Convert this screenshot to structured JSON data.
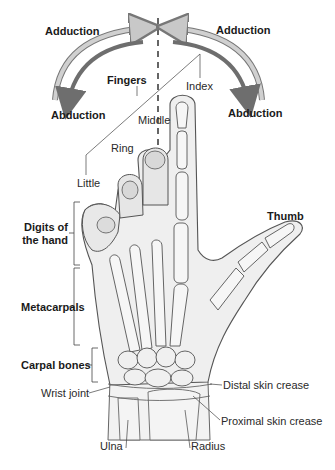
{
  "diagram": {
    "colors": {
      "adduction_arrow": "#c8c8c8",
      "abduction_arrow": "#6e6e6e",
      "midline": "#333333",
      "skin": "#efefef",
      "bone": "#f6f6f6",
      "outline": "#555555",
      "leader": "#444444"
    },
    "movements": {
      "left_adduction": "Adduction",
      "right_adduction": "Adduction",
      "left_abduction": "Abduction",
      "right_abduction": "Abduction"
    },
    "fingers": {
      "group_label": "Fingers",
      "index": "Index",
      "middle": "Middle",
      "ring": "Ring",
      "little": "Little",
      "thumb": "Thumb"
    },
    "regions": {
      "digits_line1": "Digits of",
      "digits_line2": "the hand",
      "metacarpals": "Metacarpals",
      "carpal_bones": "Carpal bones",
      "wrist_joint": "Wrist joint"
    },
    "right_labels": {
      "distal_crease": "Distal skin crease",
      "proximal_crease": "Proximal skin crease"
    },
    "forearm": {
      "ulna": "Ulna",
      "radius": "Radius"
    }
  }
}
